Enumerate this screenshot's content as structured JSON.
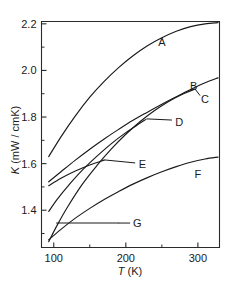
{
  "figure": {
    "background_color": "#ffffff",
    "line_color": "#1a1a1a"
  },
  "chart_data": {
    "type": "line",
    "title": "",
    "xlabel": "T (K)",
    "ylabel": "K (mW / cmK)",
    "xlabel_parts": {
      "symbol": "T",
      "unit": " (K)"
    },
    "ylabel_parts": {
      "symbol": "K",
      "unit": " (mW / cmK)"
    },
    "xlim": [
      83,
      330
    ],
    "ylim": [
      1.24,
      2.21
    ],
    "grid": false,
    "legend": "inline-labels",
    "x_ticks_major": [
      100,
      200,
      300
    ],
    "x_tick_labels": [
      "100",
      "200",
      "300"
    ],
    "x_ticks_minor": [
      150,
      250
    ],
    "y_ticks_major": [
      1.4,
      1.6,
      1.8,
      2.0,
      2.2
    ],
    "y_tick_labels": [
      "1.4",
      "1.6",
      "1.8",
      "2.0",
      "2.2"
    ],
    "y_ticks_minor": [
      1.3,
      1.5,
      1.7,
      1.9,
      2.1
    ],
    "series": [
      {
        "name": "A",
        "label": "A",
        "label_x": 250,
        "label_y": 2.12,
        "x": [
          93,
          110,
          130,
          150,
          170,
          190,
          210,
          230,
          250,
          270,
          290,
          310,
          328
        ],
        "y": [
          1.63,
          1.715,
          1.805,
          1.885,
          1.953,
          2.012,
          2.063,
          2.106,
          2.14,
          2.168,
          2.188,
          2.2,
          2.205
        ]
      },
      {
        "name": "B",
        "label": "B",
        "label_x": 294,
        "label_y": 1.935,
        "x": [
          93,
          110,
          130,
          150,
          170,
          190,
          210,
          230,
          250,
          270,
          290,
          310,
          328
        ],
        "y": [
          1.522,
          1.565,
          1.615,
          1.662,
          1.706,
          1.747,
          1.786,
          1.821,
          1.855,
          1.887,
          1.918,
          1.947,
          1.968
        ]
      },
      {
        "name": "C",
        "label": "C",
        "label_x": 310,
        "label_y": 1.877,
        "x": [
          93,
          105,
          120,
          140,
          160,
          180,
          200,
          220,
          240,
          260,
          280,
          296
        ],
        "y": [
          1.265,
          1.337,
          1.418,
          1.513,
          1.592,
          1.663,
          1.726,
          1.781,
          1.828,
          1.868,
          1.9,
          1.92
        ]
      },
      {
        "name": "D",
        "label": "D",
        "label_x": 274,
        "label_y": 1.78,
        "x": [
          93,
          105,
          120,
          140,
          160,
          180,
          200,
          215,
          228
        ],
        "y": [
          1.395,
          1.448,
          1.505,
          1.573,
          1.632,
          1.686,
          1.733,
          1.764,
          1.79
        ]
      },
      {
        "name": "E",
        "label": "E",
        "label_x": 223,
        "label_y": 1.6,
        "x": [
          93,
          110,
          130,
          150,
          170
        ],
        "y": [
          1.505,
          1.537,
          1.568,
          1.594,
          1.615
        ]
      },
      {
        "name": "F",
        "label": "F",
        "label_x": 300,
        "label_y": 1.555,
        "x": [
          93,
          110,
          130,
          150,
          170,
          190,
          210,
          230,
          250,
          270,
          290,
          310,
          328
        ],
        "y": [
          1.273,
          1.318,
          1.366,
          1.408,
          1.446,
          1.48,
          1.512,
          1.54,
          1.565,
          1.587,
          1.606,
          1.62,
          1.628
        ]
      },
      {
        "name": "G",
        "label": "G",
        "label_x": 216,
        "label_y": 1.345,
        "x": [
          104,
          130,
          160,
          190
        ],
        "y": [
          1.345,
          1.345,
          1.345,
          1.345
        ]
      }
    ],
    "leaders": [
      {
        "for": "D",
        "x1": 229,
        "y1": 1.792,
        "x2": 264,
        "y2": 1.787
      },
      {
        "for": "E",
        "x1": 170,
        "y1": 1.616,
        "x2": 213,
        "y2": 1.603
      },
      {
        "for": "G",
        "x1": 190,
        "y1": 1.345,
        "x2": 206,
        "y2": 1.345
      },
      {
        "for": "C",
        "x1": 296,
        "y1": 1.921,
        "x2": 303,
        "y2": 1.892
      }
    ]
  }
}
